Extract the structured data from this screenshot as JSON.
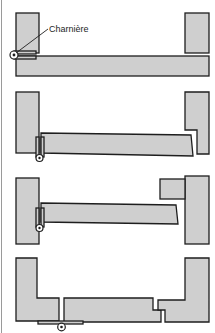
{
  "diagram": {
    "title": "",
    "colors": {
      "fill": "#cfcfcf",
      "stroke": "#1e1e1e",
      "background": "#ffffff"
    },
    "labels": {
      "hinge": "Charnière"
    },
    "panels": [
      {
        "id": 1,
        "description": "Door closed flush, hinge on outer left edge"
      },
      {
        "id": 2,
        "description": "Door with hinge inset, right post rebated"
      },
      {
        "id": 3,
        "description": "Door with hinge inset, stop block on right post"
      },
      {
        "id": 4,
        "description": "Split door with hinge underneath, rebated joint on right"
      }
    ]
  }
}
